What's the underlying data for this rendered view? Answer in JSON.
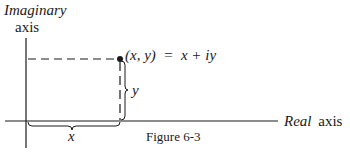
{
  "figure": {
    "caption": "Figure 6-3",
    "y_axis_label_line1": "Imaginary",
    "y_axis_label_line2": "axis",
    "x_axis_label_italic": "Real",
    "x_axis_label_plain": "axis",
    "point_label": "(x, y)  =  x + iy",
    "x_brace_label": "x",
    "y_brace_label": "y"
  },
  "colors": {
    "ink": "#1a1a1a",
    "background": "#ffffff"
  }
}
